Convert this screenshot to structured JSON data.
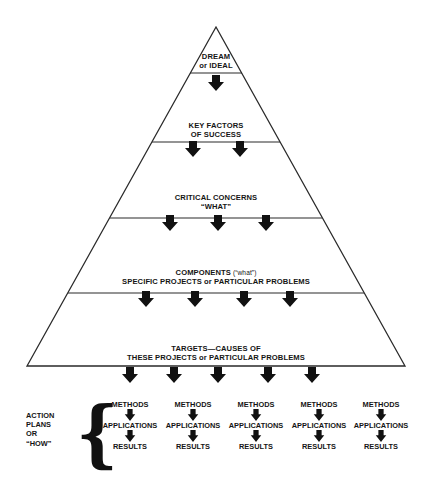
{
  "diagram": {
    "type": "pyramid",
    "colors": {
      "stroke": "#2a2a2a",
      "arrow": "#111111",
      "text": "#151515",
      "background": "#ffffff"
    },
    "levels": [
      {
        "id": "dream",
        "lines": [
          "DREAM",
          "or IDEAL"
        ],
        "arrows": 1
      },
      {
        "id": "key-factors",
        "lines": [
          "KEY FACTORS",
          "OF SUCCESS"
        ],
        "arrows": 2
      },
      {
        "id": "critical-concerns",
        "lines": [
          "CRITICAL CONCERNS",
          "“WHAT”"
        ],
        "arrows": 3
      },
      {
        "id": "components",
        "line1_main": "COMPONENTS",
        "line1_sub": " (“what”)",
        "line2": "SPECIFIC PROJECTS or PARTICULAR PROBLEMS",
        "arrows": 4
      },
      {
        "id": "targets",
        "lines": [
          "TARGETS—CAUSES OF",
          "THESE PROJECTS or PARTICULAR PROBLEMS"
        ],
        "arrows": 5
      }
    ],
    "action_plans": {
      "label_lines": [
        "ACTION",
        "PLANS",
        "OR",
        "“HOW”"
      ],
      "brace": "{",
      "columns": [
        {
          "steps": [
            "METHODS",
            "APPLICATIONS",
            "RESULTS"
          ]
        },
        {
          "steps": [
            "METHODS",
            "APPLICATIONS",
            "RESULTS"
          ]
        },
        {
          "steps": [
            "METHODS",
            "APPLICATIONS",
            "RESULTS"
          ]
        },
        {
          "steps": [
            "METHODS",
            "APPLICATIONS",
            "RESULTS"
          ]
        },
        {
          "steps": [
            "METHODS",
            "APPLICATIONS",
            "RESULTS"
          ]
        }
      ]
    }
  }
}
